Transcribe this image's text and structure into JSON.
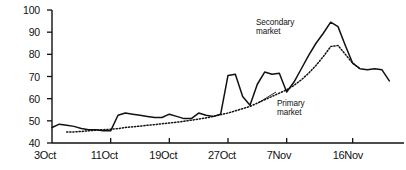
{
  "chart_data": {
    "type": "line",
    "title": "",
    "xlabel": "",
    "ylabel": "",
    "ylim": [
      40,
      100
    ],
    "yticks": [
      40,
      50,
      60,
      70,
      80,
      90,
      100
    ],
    "xticks": [
      "3Oct",
      "11Oct",
      "19Oct",
      "27Oct",
      "7Nov",
      "16Nov"
    ],
    "xtick_positions": [
      0,
      8,
      16,
      24,
      32,
      41
    ],
    "grid": false,
    "legend": "inline-annotations",
    "xlim": [
      0,
      48
    ],
    "series": [
      {
        "name": "Secondary market",
        "style": "solid",
        "color": "#111111",
        "x": [
          0,
          1,
          2,
          3,
          4,
          5,
          6,
          7,
          8,
          9,
          10,
          11,
          12,
          13,
          14,
          15,
          16,
          17,
          18,
          19,
          20,
          21,
          22,
          23,
          24,
          25,
          26,
          27,
          28,
          29,
          30,
          31,
          32,
          33,
          34,
          35,
          36,
          37,
          38,
          39,
          40,
          41,
          42,
          43,
          44,
          45,
          46
        ],
        "values": [
          47,
          48.5,
          48,
          47.5,
          46.5,
          46,
          46,
          45.5,
          45.5,
          52.5,
          53.5,
          53,
          52.5,
          52,
          51.5,
          51.5,
          53,
          52,
          51,
          51,
          53.5,
          52.5,
          52,
          53,
          70.5,
          71,
          61,
          57,
          66.5,
          72,
          71,
          71.5,
          63,
          67.5,
          73.5,
          79.5,
          85,
          89.5,
          94.5,
          92.5,
          84,
          76,
          73.5,
          73,
          73.5,
          73,
          68
        ]
      },
      {
        "name": "Primary market",
        "style": "dotted",
        "color": "#111111",
        "x": [
          2,
          3,
          4,
          5,
          6,
          7,
          8,
          9,
          10,
          11,
          12,
          13,
          14,
          15,
          16,
          17,
          18,
          19,
          20,
          21,
          22,
          23,
          24,
          25,
          26,
          27,
          28,
          29,
          30,
          31,
          32,
          33,
          34,
          35,
          36,
          37,
          38,
          39,
          40,
          41,
          42
        ],
        "values": [
          45,
          45,
          45.2,
          45.5,
          45.8,
          46,
          46.2,
          46.5,
          47,
          47.3,
          47.6,
          48,
          48.3,
          48.7,
          49,
          49.4,
          49.8,
          50.3,
          50.8,
          51.3,
          52,
          52.8,
          53.5,
          54.5,
          55.5,
          56.5,
          58,
          59.5,
          61,
          62.5,
          64,
          66,
          68.5,
          71.5,
          75,
          79,
          83.5,
          84,
          80,
          76,
          73.5
        ]
      }
    ],
    "annotations": [
      {
        "name": "secondary-market-label",
        "text_line1": "Secondary",
        "text_line2": "market",
        "x_px": 256,
        "y_px": 18
      },
      {
        "name": "primary-market-label",
        "text_line1": "Primary",
        "text_line2": "market",
        "x_px": 276,
        "y_px": 99
      }
    ]
  },
  "axes": {
    "y_labels": [
      "100",
      "90",
      "80",
      "70",
      "60",
      "50",
      "40"
    ],
    "x_labels": [
      "3Oct",
      "11Oct",
      "19Oct",
      "27Oct",
      "7Nov",
      "16Nov"
    ]
  },
  "labels": {
    "secondary_line1": "Secondary",
    "secondary_line2": "market",
    "primary_line1": "Primary",
    "primary_line2": "market"
  },
  "colors": {
    "axis": "#111111",
    "secondary_series": "#111111",
    "primary_series": "#111111",
    "background": "#ffffff"
  }
}
